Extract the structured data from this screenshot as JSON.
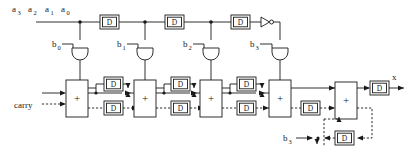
{
  "figure": {
    "kind": "digital-logic-schematic",
    "background_color": "#ffffff",
    "line_color": "#1a1a1a",
    "width": 413,
    "height": 156
  },
  "inputs": {
    "a_bus": {
      "labels": [
        "a",
        "a",
        "a",
        "a"
      ],
      "subscripts": [
        "3",
        "2",
        "1",
        "0"
      ],
      "full_labels": [
        "a3",
        "a2",
        "a1",
        "a0"
      ],
      "description": "serial multiplicand input bits, most significant first"
    },
    "carry_label": "carry",
    "b_coefficients": [
      {
        "label": "b",
        "subscript": "0",
        "full_label": "b0"
      },
      {
        "label": "b",
        "subscript": "1",
        "full_label": "b1"
      },
      {
        "label": "b",
        "subscript": "2",
        "full_label": "b2"
      },
      {
        "label": "b",
        "subscript": "3",
        "full_label": "b3"
      }
    ],
    "b3_feedback": {
      "label": "b",
      "subscript": "3",
      "full_label": "b3"
    }
  },
  "outputs": {
    "x": {
      "label": "x",
      "description": "serial product output"
    }
  },
  "components": {
    "delay_label": "D",
    "adder_label": "+",
    "and_gate_name": "and-gate",
    "inverter_name": "inverter-gate",
    "top_delays": [
      {
        "id": "d-top-1",
        "label": "D"
      },
      {
        "id": "d-top-2",
        "label": "D"
      },
      {
        "id": "d-top-3",
        "label": "D"
      }
    ],
    "adders": [
      {
        "id": "adder-0",
        "label": "+"
      },
      {
        "id": "adder-1",
        "label": "+"
      },
      {
        "id": "adder-2",
        "label": "+"
      },
      {
        "id": "adder-3",
        "label": "+"
      },
      {
        "id": "adder-out",
        "label": "+"
      }
    ],
    "sum_delays": [
      {
        "id": "d-sum-0",
        "label": "D"
      },
      {
        "id": "d-sum-1",
        "label": "D"
      },
      {
        "id": "d-sum-2",
        "label": "D"
      }
    ],
    "carry_delays": [
      {
        "id": "d-carry-0",
        "label": "D"
      },
      {
        "id": "d-carry-1",
        "label": "D"
      },
      {
        "id": "d-carry-2",
        "label": "D"
      },
      {
        "id": "d-carry-3",
        "label": "D"
      }
    ],
    "output_delay": {
      "id": "d-output",
      "label": "D"
    },
    "feedback_delay": {
      "id": "d-feedback",
      "label": "D"
    },
    "and_gates": [
      {
        "id": "and-b0",
        "inputs": [
          "a-bus",
          "b0"
        ]
      },
      {
        "id": "and-b1",
        "inputs": [
          "a-bus",
          "b1"
        ]
      },
      {
        "id": "and-b2",
        "inputs": [
          "a-bus",
          "b2"
        ]
      },
      {
        "id": "and-b3",
        "inputs": [
          "inverted-a",
          "b3"
        ]
      }
    ],
    "inverter": {
      "id": "inv-1",
      "symbol": "triangle-with-bubble"
    }
  },
  "line_styles": {
    "sum_path": "solid",
    "carry_path": "dashed"
  }
}
